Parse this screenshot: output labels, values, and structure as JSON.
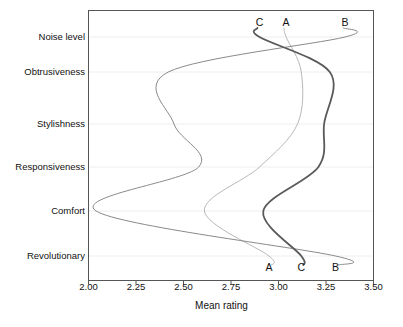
{
  "chart_data": {
    "type": "line",
    "title": "",
    "xlabel": "Mean rating",
    "ylabel": "",
    "xlim": [
      2.0,
      3.5
    ],
    "xticks": [
      "2.00",
      "2.25",
      "2.50",
      "2.75",
      "3.00",
      "3.25",
      "3.50"
    ],
    "xtick_values": [
      2.0,
      2.25,
      2.5,
      2.75,
      3.0,
      3.25,
      3.5
    ],
    "categories": [
      "Noise level",
      "Obtrusiveness",
      "Stylishness",
      "Responsiveness",
      "Comfort",
      "Revolutionary"
    ],
    "grid": true,
    "legend": "inline-endpoint-labels",
    "orientation": "horizontal-profile",
    "series": [
      {
        "name": "A",
        "color": "#b8b8b8",
        "width": 1.0,
        "top_label": "A",
        "bottom_label": "A",
        "values": [
          3.04,
          3.12,
          3.1,
          2.9,
          2.61,
          2.95
        ]
      },
      {
        "name": "B",
        "color": "#8a8a8a",
        "width": 1.0,
        "top_label": "B",
        "bottom_label": "B",
        "values": [
          3.35,
          2.42,
          2.45,
          2.58,
          2.04,
          3.3
        ]
      },
      {
        "name": "C",
        "color": "#5a5a5a",
        "width": 1.8,
        "top_label": "C",
        "bottom_label": "C",
        "values": [
          2.9,
          3.27,
          3.24,
          3.21,
          2.92,
          3.12
        ]
      }
    ],
    "top_labels": [
      {
        "text": "C",
        "x": 2.9
      },
      {
        "text": "A",
        "x": 3.04
      },
      {
        "text": "B",
        "x": 3.35
      }
    ],
    "bottom_labels": [
      {
        "text": "A",
        "x": 2.95
      },
      {
        "text": "C",
        "x": 3.12
      },
      {
        "text": "B",
        "x": 3.3
      }
    ]
  },
  "axis": {
    "x_title": "Mean rating",
    "y_categories": [
      "Noise level",
      "Obtrusiveness",
      "Stylishness",
      "Responsiveness",
      "Comfort",
      "Revolutionary"
    ],
    "x_ticks": [
      "2.00",
      "2.25",
      "2.50",
      "2.75",
      "3.00",
      "3.25",
      "3.50"
    ]
  },
  "colors": {
    "frame": "#555555",
    "grid": "#eeeeee",
    "series_a": "#b8b8b8",
    "series_b": "#8a8a8a",
    "series_c": "#5a5a5a",
    "background": "#ffffff"
  }
}
